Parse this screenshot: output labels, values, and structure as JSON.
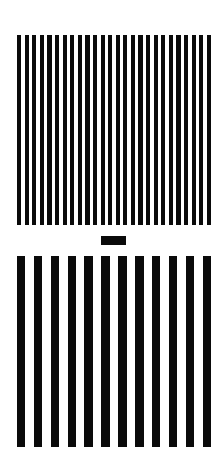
{
  "stimulus": {
    "background_color": "#ffffff",
    "bar_color": "#0a0a0a",
    "top_grating": {
      "label": "high-frequency grating",
      "bar_count": 26,
      "x": 17,
      "y": 35,
      "width": 194,
      "height": 190,
      "bar_width_ratio": 0.55
    },
    "fixation_mark": {
      "x": 101,
      "y": 236,
      "width": 25,
      "height": 9
    },
    "bottom_grating": {
      "label": "low-frequency grating",
      "bar_count": 12,
      "x": 17,
      "y": 256,
      "width": 194,
      "height": 191,
      "bar_width_ratio": 0.5
    }
  }
}
